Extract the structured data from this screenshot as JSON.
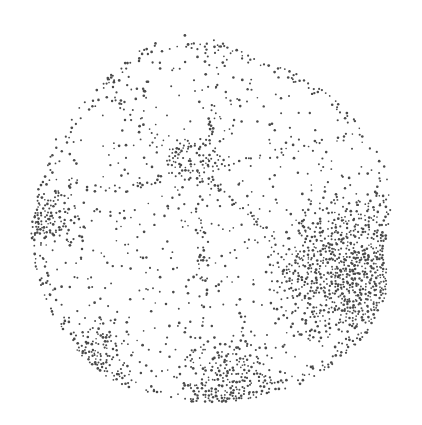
{
  "image": {
    "subject": "stippled illustration of a foraminifera shell (umbilical view)",
    "width": 422,
    "height": 425,
    "background": "#ffffff",
    "ink_color": "#4a4a4a"
  },
  "shell_outline": [
    [
      150,
      42
    ],
    [
      185,
      35
    ],
    [
      215,
      40
    ],
    [
      250,
      55
    ],
    [
      290,
      70
    ],
    [
      330,
      95
    ],
    [
      360,
      125
    ],
    [
      385,
      165
    ],
    [
      392,
      205
    ],
    [
      385,
      245
    ],
    [
      388,
      290
    ],
    [
      370,
      330
    ],
    [
      340,
      360
    ],
    [
      300,
      385
    ],
    [
      250,
      400
    ],
    [
      200,
      403
    ],
    [
      150,
      395
    ],
    [
      110,
      380
    ],
    [
      80,
      355
    ],
    [
      55,
      320
    ],
    [
      38,
      280
    ],
    [
      30,
      235
    ],
    [
      38,
      185
    ],
    [
      55,
      140
    ],
    [
      85,
      100
    ],
    [
      115,
      70
    ]
  ],
  "umbilicus": {
    "cx": 195,
    "cy": 160,
    "rx": 30,
    "ry": 22,
    "density": 0.55
  },
  "sutures": [
    [
      [
        170,
        150
      ],
      [
        120,
        100
      ],
      [
        100,
        75
      ]
    ],
    [
      [
        210,
        140
      ],
      [
        215,
        90
      ],
      [
        225,
        55
      ]
    ],
    [
      [
        222,
        165
      ],
      [
        290,
        150
      ],
      [
        345,
        135
      ]
    ],
    [
      [
        200,
        182
      ],
      [
        200,
        260
      ],
      [
        205,
        330
      ]
    ],
    [
      [
        175,
        172
      ],
      [
        125,
        190
      ],
      [
        70,
        185
      ]
    ],
    [
      [
        210,
        180
      ],
      [
        265,
        230
      ],
      [
        300,
        300
      ]
    ]
  ],
  "shading_regions": [
    {
      "name": "right-dark-flank",
      "cx": 350,
      "cy": 270,
      "r": 90,
      "density": 0.85
    },
    {
      "name": "bottom-rim",
      "cx": 230,
      "cy": 390,
      "r": 60,
      "density": 0.7
    },
    {
      "name": "left-rim",
      "cx": 45,
      "cy": 220,
      "r": 40,
      "density": 0.6
    },
    {
      "name": "lower-left-rim",
      "cx": 95,
      "cy": 355,
      "r": 40,
      "density": 0.55
    }
  ],
  "base_density": 0.06,
  "seed": 7
}
